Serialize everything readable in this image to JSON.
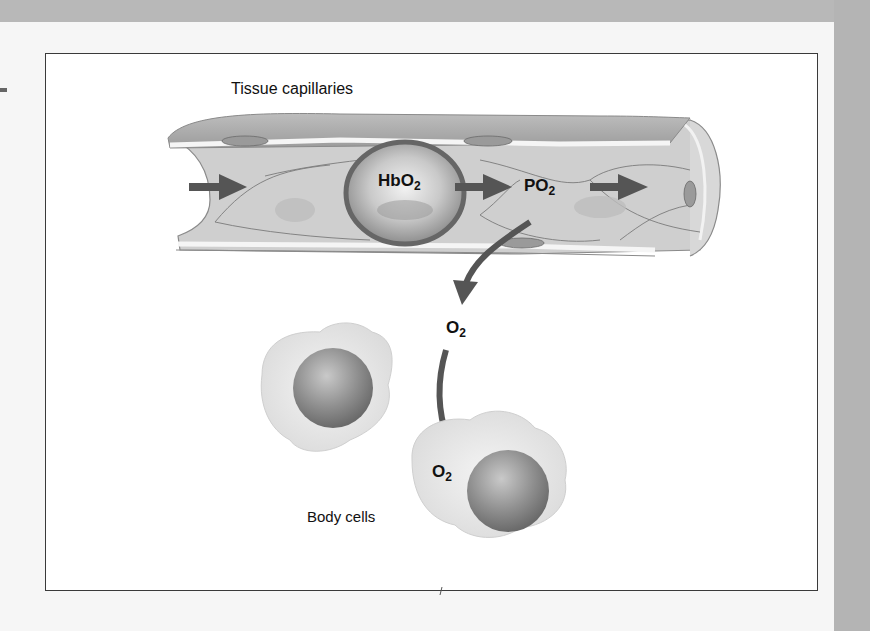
{
  "figure": {
    "title": "Tissue capillaries",
    "caption": "Body cells",
    "labels": {
      "hbo2": {
        "main": "HbO",
        "sub": "2"
      },
      "po2": {
        "main": "PO",
        "sub": "2"
      },
      "o2_mid": {
        "main": "O",
        "sub": "2"
      },
      "o2_cell": {
        "main": "O",
        "sub": "2"
      }
    },
    "colors": {
      "frame_border": "#3a3a3a",
      "capillary_fill": "#cfcfcf",
      "capillary_wall": "#a9a9a9",
      "arrow": "#555555",
      "rbc_ring": "#6b6b6b",
      "cell_fill": "#e6e6e6",
      "nucleus": "#8a8a8a",
      "page_band": "#b8b8b8"
    }
  }
}
